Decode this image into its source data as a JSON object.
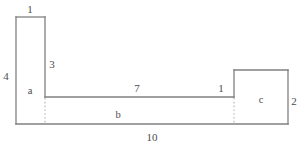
{
  "figure": {
    "type": "composite-rectilinear-shape",
    "stroke_color": "#808080",
    "dotted_color": "#b5b5b5",
    "text_color": "#4d4d4d",
    "background": "#ffffff",
    "regions": [
      {
        "id": "region-a",
        "label": "a",
        "x": 30,
        "y": 91
      },
      {
        "id": "region-b",
        "label": "b",
        "x": 118,
        "y": 115
      },
      {
        "id": "region-c",
        "label": "c",
        "x": 261,
        "y": 100
      }
    ],
    "dimensions": [
      {
        "id": "dim-top-left-width",
        "label": "1",
        "x": 30,
        "y": 9
      },
      {
        "id": "dim-left-height",
        "label": "4",
        "x": 6,
        "y": 76
      },
      {
        "id": "dim-inner-vertical",
        "label": "3",
        "x": 52,
        "y": 64
      },
      {
        "id": "dim-middle-width",
        "label": "7",
        "x": 137,
        "y": 88
      },
      {
        "id": "dim-right-gap",
        "label": "1",
        "x": 221,
        "y": 88
      },
      {
        "id": "dim-right-height",
        "label": "2",
        "x": 294,
        "y": 101
      },
      {
        "id": "dim-bottom-width",
        "label": "10",
        "x": 152,
        "y": 137
      }
    ],
    "geometry": {
      "solid_paths": [
        "M 16 17 L 45 17",
        "M 16 17 L 16 124",
        "M 45 17 L 45 97",
        "M 45 97 L 234 97",
        "M 16 124 L 288 124",
        "M 234 70 L 288 70",
        "M 288 70 L 288 124",
        "M 234 70 L 234 97"
      ],
      "dotted_paths": [
        "M 45 98 L 45 124",
        "M 234 98 L 234 124"
      ]
    }
  }
}
